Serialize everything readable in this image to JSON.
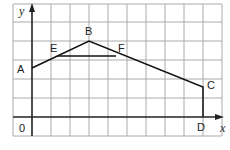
{
  "diagram": {
    "type": "coordinate-graph",
    "axes": {
      "x_label": "x",
      "y_label": "y",
      "origin_label": "0"
    },
    "grid": {
      "columns": 11,
      "rows": 7,
      "cell_px": 19
    },
    "points": [
      {
        "name": "A",
        "grid": [
          0,
          2.6
        ]
      },
      {
        "name": "B",
        "grid": [
          3,
          4
        ]
      },
      {
        "name": "C",
        "grid": [
          9,
          1.6
        ]
      },
      {
        "name": "D",
        "grid": [
          9,
          0
        ]
      },
      {
        "name": "E",
        "grid": [
          1.3,
          3.1
        ]
      },
      {
        "name": "F",
        "grid": [
          4.4,
          3.1
        ]
      }
    ],
    "segments": [
      [
        "A",
        "B"
      ],
      [
        "B",
        "C"
      ],
      [
        "C",
        "D"
      ],
      [
        "E",
        "F"
      ]
    ],
    "colors": {
      "grid": "#aaaaaa",
      "axis": "#222222",
      "line": "#111111"
    }
  }
}
